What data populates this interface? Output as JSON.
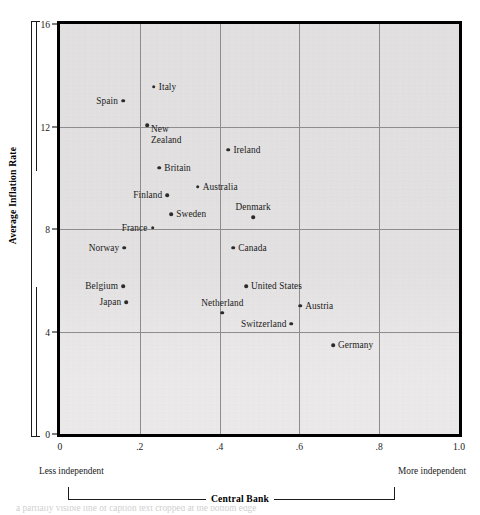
{
  "chart_data": {
    "type": "scatter",
    "title": "",
    "xlabel": "Central Bank",
    "ylabel": "Average Inflation Rate",
    "xlim": [
      0,
      1.0
    ],
    "ylim": [
      0,
      16
    ],
    "grid": true,
    "legend": "none",
    "x_tick_labels": [
      "0",
      ".2",
      ".4",
      ".6",
      ".8",
      "1.0"
    ],
    "x_tick_values": [
      0,
      0.2,
      0.4,
      0.6,
      0.8,
      1.0
    ],
    "y_tick_labels": [
      "0",
      "4",
      "8",
      "12",
      "16"
    ],
    "y_tick_values": [
      0,
      4,
      8,
      12,
      16
    ],
    "x_axis_low_end_label": "Less independent",
    "x_axis_high_end_label": "More independent",
    "points": [
      {
        "name": "Italy",
        "x": 0.235,
        "y": 13.55,
        "label_pos": "right"
      },
      {
        "name": "Spain",
        "x": 0.158,
        "y": 13.0,
        "label_pos": "left"
      },
      {
        "name": "New\nZealand",
        "x": 0.218,
        "y": 12.05,
        "label_pos": "right-block"
      },
      {
        "name": "Ireland",
        "x": 0.422,
        "y": 11.1,
        "label_pos": "right"
      },
      {
        "name": "Britain",
        "x": 0.249,
        "y": 10.4,
        "label_pos": "right"
      },
      {
        "name": "Australia",
        "x": 0.345,
        "y": 9.65,
        "label_pos": "right"
      },
      {
        "name": "Finland",
        "x": 0.269,
        "y": 9.31,
        "label_pos": "left"
      },
      {
        "name": "Sweden",
        "x": 0.279,
        "y": 8.58,
        "label_pos": "right"
      },
      {
        "name": "France",
        "x": 0.232,
        "y": 8.05,
        "label_pos": "left"
      },
      {
        "name": "Denmark",
        "x": 0.484,
        "y": 8.46,
        "label_pos": "above"
      },
      {
        "name": "Norway",
        "x": 0.161,
        "y": 7.27,
        "label_pos": "left"
      },
      {
        "name": "Canada",
        "x": 0.434,
        "y": 7.27,
        "label_pos": "right"
      },
      {
        "name": "Belgium",
        "x": 0.158,
        "y": 5.77,
        "label_pos": "left"
      },
      {
        "name": "United States",
        "x": 0.466,
        "y": 5.77,
        "label_pos": "right"
      },
      {
        "name": "Japan",
        "x": 0.166,
        "y": 5.15,
        "label_pos": "left"
      },
      {
        "name": "Austria",
        "x": 0.602,
        "y": 5.0,
        "label_pos": "right"
      },
      {
        "name": "Netherland",
        "x": 0.407,
        "y": 4.73,
        "label_pos": "above"
      },
      {
        "name": "Switzerland",
        "x": 0.58,
        "y": 4.31,
        "label_pos": "left"
      },
      {
        "name": "Germany",
        "x": 0.684,
        "y": 3.46,
        "label_pos": "right"
      }
    ]
  },
  "axes": {
    "y_title": "Average Inflation Rate",
    "x_title": "Central Bank",
    "x_low_label": "Less independent",
    "x_high_label": "More independent"
  },
  "caption": {
    "cropped_line": "a partially visible line of caption text cropped at the bottom edge"
  }
}
